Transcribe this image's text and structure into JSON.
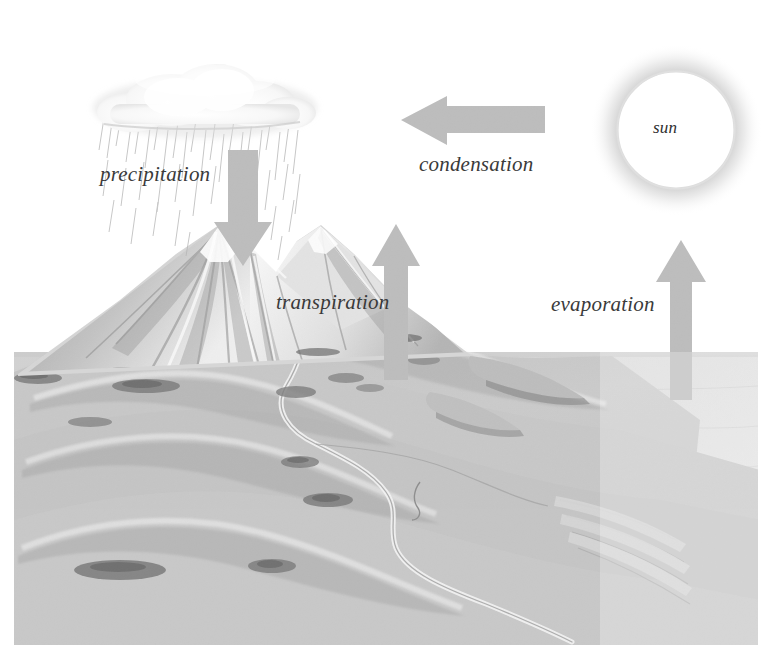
{
  "diagram": {
    "background_color": "#ffffff",
    "arrow_color": "#b9b9b9",
    "land_color": "#c9c9c9",
    "sea_color": "#dcdcdc",
    "label_color": "#3a3a3a"
  },
  "labels": {
    "precipitation": "precipitation",
    "condensation": "condensation",
    "transpiration": "transpiration",
    "evaporation": "evaporation",
    "sun": "sun"
  },
  "elements": {
    "cloud": "cloud",
    "rain": "rain-streaks",
    "mountain": "mountain",
    "hills": "rolling-hills",
    "river": "river",
    "sea": "sea",
    "shrubs": "vegetation-clumps",
    "sun_disc": "sun-disc"
  },
  "arrows": [
    {
      "name": "precipitation-arrow",
      "direction": "down",
      "label": "precipitation"
    },
    {
      "name": "condensation-arrow",
      "direction": "left",
      "label": "condensation"
    },
    {
      "name": "transpiration-arrow",
      "direction": "up",
      "label": "transpiration"
    },
    {
      "name": "evaporation-arrow",
      "direction": "up",
      "label": "evaporation"
    }
  ]
}
